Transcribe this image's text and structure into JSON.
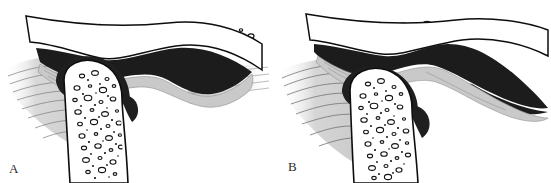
{
  "figure": {
    "width": 551,
    "height": 183,
    "background_color": "#ffffff",
    "panel_count": 2
  },
  "palette": {
    "outline": "#0d0d0d",
    "bone_fill": "#ffffff",
    "trabecula_outline": "#111111",
    "disc_dark": "#1c1c1c",
    "disc_dark_secondary": "#262626",
    "capsule_gray": "#c9c9c9",
    "capsule_gray_light": "#dedede",
    "soft_tissue_gray": "#bfbfbf",
    "striation_line": "#6e6e6e",
    "label_color": "#2b2b2b"
  },
  "panels": [
    {
      "id": "panel-a",
      "label": "A",
      "label_x": 9,
      "label_y": 162,
      "caption": "Normal disc position",
      "structures": [
        {
          "name": "temporal-bone",
          "fill": "#ffffff",
          "outline": "#0d0d0d"
        },
        {
          "name": "articular-disc",
          "fill": "#1c1c1c",
          "position": "normal"
        },
        {
          "name": "joint-capsule",
          "fill": "#c9c9c9"
        },
        {
          "name": "mandibular-condyle",
          "fill": "#ffffff",
          "outline": "#0d0d0d"
        },
        {
          "name": "retrodiscal-tissue",
          "fill": "#bfbfbf"
        }
      ]
    },
    {
      "id": "panel-b",
      "label": "B",
      "label_x": 288,
      "label_y": 160,
      "caption": "Anterior disc displacement",
      "structures": [
        {
          "name": "temporal-bone",
          "fill": "#ffffff",
          "outline": "#0d0d0d"
        },
        {
          "name": "articular-disc",
          "fill": "#1c1c1c",
          "position": "displaced-anterior"
        },
        {
          "name": "joint-capsule",
          "fill": "#c9c9c9"
        },
        {
          "name": "mandibular-condyle",
          "fill": "#ffffff",
          "outline": "#0d0d0d"
        },
        {
          "name": "retrodiscal-tissue",
          "fill": "#bfbfbf"
        }
      ]
    }
  ]
}
